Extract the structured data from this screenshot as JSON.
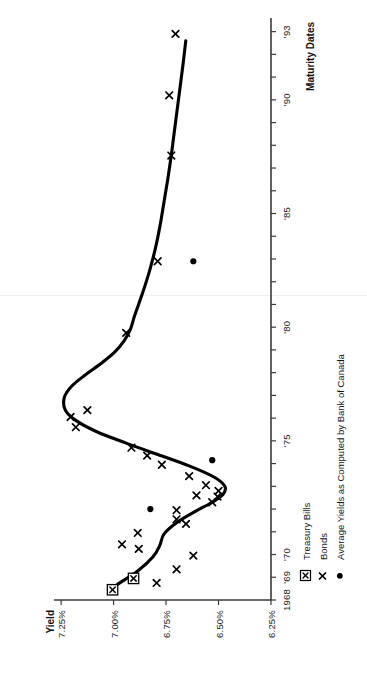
{
  "figure": {
    "orientation": "rotated-90-ccw",
    "background": "#ffffff",
    "ink": "#000000"
  },
  "axis_titles": {
    "yield": "Yield",
    "maturity": "Maturity Dates"
  },
  "legend": {
    "items": [
      {
        "marker": "boxed-x-icon",
        "label": "Treasury Bills"
      },
      {
        "marker": "x-icon",
        "label": "Bonds"
      },
      {
        "marker": "dot-icon",
        "label": "Average Yields as Computed by Bank of Canada"
      }
    ]
  },
  "chart_data": {
    "type": "scatter",
    "title": "",
    "subtitle": "",
    "xlabel": "Maturity Dates",
    "ylabel": "Yield",
    "xlim": [
      1968,
      1993.6
    ],
    "ylim": [
      6.25,
      7.3125
    ],
    "grid": false,
    "legend_position": "bottom-left",
    "xtick_values": [
      1968,
      1969,
      1970,
      1971,
      1972,
      1973,
      1974,
      1975,
      1976,
      1977,
      1978,
      1979,
      1980,
      1981,
      1982,
      1983,
      1984,
      1985,
      1986,
      1987,
      1988,
      1989,
      1990,
      1991,
      1992,
      1993
    ],
    "xtick_labels": [
      "1968",
      "'69",
      "'70",
      "",
      "",
      "",
      "",
      "'75",
      "",
      "",
      "",
      "",
      "'80",
      "",
      "",
      "",
      "",
      "'85",
      "",
      "",
      "",
      "",
      "'90",
      "",
      "",
      "'93"
    ],
    "ytick_values": [
      6.25,
      6.5,
      6.75,
      7.0,
      7.25
    ],
    "ytick_labels": [
      "6.25%",
      "6.50%",
      "6.75%",
      "7.00%",
      "7.25%"
    ],
    "series": [
      {
        "name": "Treasury Bills",
        "marker": "boxed-x",
        "points": [
          {
            "x": 1968.45,
            "y": 7.005
          },
          {
            "x": 1968.95,
            "y": 6.905
          }
        ]
      },
      {
        "name": "Bonds",
        "marker": "x",
        "points": [
          {
            "x": 1968.75,
            "y": 6.795
          },
          {
            "x": 1969.35,
            "y": 6.7
          },
          {
            "x": 1969.95,
            "y": 6.62
          },
          {
            "x": 1970.25,
            "y": 6.88
          },
          {
            "x": 1970.45,
            "y": 6.96
          },
          {
            "x": 1970.95,
            "y": 6.885
          },
          {
            "x": 1971.35,
            "y": 6.655
          },
          {
            "x": 1971.55,
            "y": 6.7
          },
          {
            "x": 1971.95,
            "y": 6.7
          },
          {
            "x": 1972.3,
            "y": 6.53
          },
          {
            "x": 1972.55,
            "y": 6.505
          },
          {
            "x": 1972.8,
            "y": 6.5
          },
          {
            "x": 1972.6,
            "y": 6.605
          },
          {
            "x": 1973.05,
            "y": 6.56
          },
          {
            "x": 1973.45,
            "y": 6.64
          },
          {
            "x": 1973.95,
            "y": 6.77
          },
          {
            "x": 1974.35,
            "y": 6.84
          },
          {
            "x": 1974.7,
            "y": 6.915
          },
          {
            "x": 1975.6,
            "y": 7.18
          },
          {
            "x": 1976.05,
            "y": 7.205
          },
          {
            "x": 1976.35,
            "y": 7.125
          },
          {
            "x": 1979.75,
            "y": 6.94
          },
          {
            "x": 1982.9,
            "y": 6.79
          },
          {
            "x": 1987.55,
            "y": 6.725
          },
          {
            "x": 1990.2,
            "y": 6.735
          },
          {
            "x": 1992.9,
            "y": 6.705
          }
        ]
      },
      {
        "name": "Average Yields as Computed by Bank of Canada",
        "marker": "dot",
        "points": [
          {
            "x": 1972.0,
            "y": 6.825
          },
          {
            "x": 1974.15,
            "y": 6.53
          },
          {
            "x": 1982.9,
            "y": 6.62
          }
        ]
      },
      {
        "name": "Fitted Curve",
        "marker": "line",
        "points": [
          {
            "x": 1968.7,
            "y": 6.98
          },
          {
            "x": 1969.3,
            "y": 6.882
          },
          {
            "x": 1969.9,
            "y": 6.812
          },
          {
            "x": 1970.4,
            "y": 6.78
          },
          {
            "x": 1970.9,
            "y": 6.76
          },
          {
            "x": 1971.4,
            "y": 6.7
          },
          {
            "x": 1971.9,
            "y": 6.61
          },
          {
            "x": 1972.3,
            "y": 6.53
          },
          {
            "x": 1972.65,
            "y": 6.478
          },
          {
            "x": 1973.0,
            "y": 6.47
          },
          {
            "x": 1973.4,
            "y": 6.52
          },
          {
            "x": 1973.9,
            "y": 6.64
          },
          {
            "x": 1974.4,
            "y": 6.79
          },
          {
            "x": 1974.9,
            "y": 6.94
          },
          {
            "x": 1975.4,
            "y": 7.08
          },
          {
            "x": 1975.9,
            "y": 7.18
          },
          {
            "x": 1976.35,
            "y": 7.23
          },
          {
            "x": 1976.9,
            "y": 7.235
          },
          {
            "x": 1977.4,
            "y": 7.2
          },
          {
            "x": 1977.9,
            "y": 7.135
          },
          {
            "x": 1978.4,
            "y": 7.06
          },
          {
            "x": 1978.9,
            "y": 6.995
          },
          {
            "x": 1979.4,
            "y": 6.95
          },
          {
            "x": 1979.9,
            "y": 6.92
          },
          {
            "x": 1980.5,
            "y": 6.9
          },
          {
            "x": 1981.5,
            "y": 6.862
          },
          {
            "x": 1982.5,
            "y": 6.828
          },
          {
            "x": 1983.5,
            "y": 6.8
          },
          {
            "x": 1984.5,
            "y": 6.778
          },
          {
            "x": 1985.5,
            "y": 6.76
          },
          {
            "x": 1986.5,
            "y": 6.742
          },
          {
            "x": 1987.5,
            "y": 6.726
          },
          {
            "x": 1988.5,
            "y": 6.712
          },
          {
            "x": 1989.5,
            "y": 6.698
          },
          {
            "x": 1990.5,
            "y": 6.684
          },
          {
            "x": 1991.5,
            "y": 6.67
          },
          {
            "x": 1992.6,
            "y": 6.656
          }
        ]
      }
    ]
  }
}
